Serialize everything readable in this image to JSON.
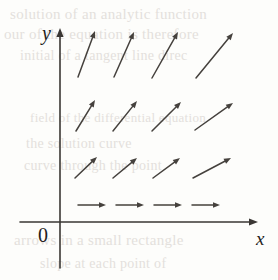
{
  "figure": {
    "kind": "direction-field",
    "background_color": "#fdfdfb",
    "ink_color": "#3a3734",
    "ghost_text_color": "#cfc9c4"
  },
  "axes": {
    "x_label": "x",
    "y_label": "y",
    "origin_label": "0",
    "x_axis": {
      "y_px": 222,
      "x_start_px": 20,
      "x_end_px": 258,
      "arrowhead": "right"
    },
    "y_axis": {
      "x_px": 60,
      "y_start_px": 268,
      "y_end_px": 28,
      "arrowhead": "up"
    },
    "axis_color": "#3a3734",
    "axis_stroke_width": 1.6
  },
  "ghost_text": [
    {
      "text": "solution of an analytic function",
      "x": 10,
      "y": 6,
      "size": 15
    },
    {
      "text": "our of the equation is therefore",
      "x": 4,
      "y": 26,
      "size": 15
    },
    {
      "text": "initial of a tangent line direc",
      "x": 20,
      "y": 48,
      "size": 14
    },
    {
      "text": "field of the differential equation",
      "x": 30,
      "y": 110,
      "size": 13
    },
    {
      "text": "the solution curve",
      "x": 26,
      "y": 136,
      "size": 14
    },
    {
      "text": "curve through the point",
      "x": 24,
      "y": 158,
      "size": 14
    },
    {
      "text": "arrows in a small rectangle",
      "x": 14,
      "y": 232,
      "size": 15
    },
    {
      "text": "slope at each point of",
      "x": 40,
      "y": 256,
      "size": 14
    }
  ],
  "chart_data": {
    "type": "scatter",
    "title": "",
    "xlabel": "x",
    "ylabel": "y",
    "grid": false,
    "legend": null,
    "quadrant": "first",
    "arrow_color": "#45413d",
    "arrow_stroke_width": 1.5,
    "arrowhead_length": 7,
    "arrowhead_half_width": 2.8,
    "row_count": 4,
    "column_count": 4,
    "note": "Each arrow is a unit tangent segment of a slope field. Angles are measured counter-clockwise from the positive x-axis, in degrees.",
    "rows": [
      {
        "row_index": 0,
        "row_label": "top row (largest y)",
        "approx_angles_deg": [
          70,
          66,
          60,
          50
        ],
        "arrows": [
          {
            "x1": 78,
            "y1": 77,
            "x2": 95,
            "y2": 31,
            "angle_deg": 70
          },
          {
            "x1": 114,
            "y1": 77,
            "x2": 134,
            "y2": 32,
            "angle_deg": 66
          },
          {
            "x1": 152,
            "y1": 78,
            "x2": 178,
            "y2": 32,
            "angle_deg": 60
          },
          {
            "x1": 196,
            "y1": 78,
            "x2": 233,
            "y2": 33,
            "angle_deg": 50
          }
        ]
      },
      {
        "row_index": 1,
        "row_label": "second row",
        "approx_angles_deg": [
          58,
          52,
          45,
          35
        ],
        "arrows": [
          {
            "x1": 76,
            "y1": 131,
            "x2": 95,
            "y2": 100,
            "angle_deg": 58
          },
          {
            "x1": 113,
            "y1": 131,
            "x2": 137,
            "y2": 101,
            "angle_deg": 52
          },
          {
            "x1": 152,
            "y1": 131,
            "x2": 181,
            "y2": 102,
            "angle_deg": 45
          },
          {
            "x1": 195,
            "y1": 130,
            "x2": 233,
            "y2": 103,
            "angle_deg": 35
          }
        ]
      },
      {
        "row_index": 2,
        "row_label": "third row",
        "approx_angles_deg": [
          43,
          38,
          33,
          27
        ],
        "arrows": [
          {
            "x1": 75,
            "y1": 178,
            "x2": 97,
            "y2": 157,
            "angle_deg": 43
          },
          {
            "x1": 113,
            "y1": 178,
            "x2": 137,
            "y2": 158,
            "angle_deg": 38
          },
          {
            "x1": 153,
            "y1": 178,
            "x2": 180,
            "y2": 158,
            "angle_deg": 33
          },
          {
            "x1": 193,
            "y1": 178,
            "x2": 231,
            "y2": 158,
            "angle_deg": 27
          }
        ]
      },
      {
        "row_index": 3,
        "row_label": "bottom row (near x-axis)",
        "approx_angles_deg": [
          0,
          0,
          0,
          0
        ],
        "arrows": [
          {
            "x1": 78,
            "y1": 205,
            "x2": 106,
            "y2": 205,
            "angle_deg": 0
          },
          {
            "x1": 116,
            "y1": 205,
            "x2": 144,
            "y2": 205,
            "angle_deg": 0
          },
          {
            "x1": 154,
            "y1": 205,
            "x2": 182,
            "y2": 205,
            "angle_deg": 0
          },
          {
            "x1": 192,
            "y1": 205,
            "x2": 220,
            "y2": 205,
            "angle_deg": 0
          }
        ]
      }
    ]
  }
}
